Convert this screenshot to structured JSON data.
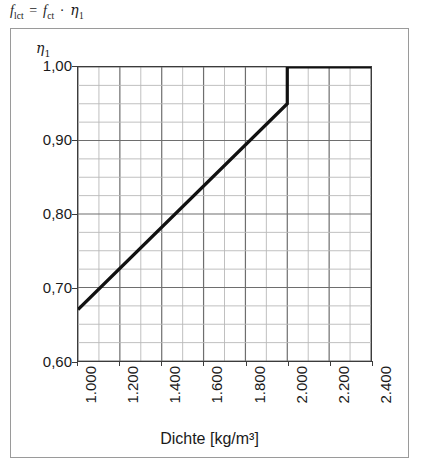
{
  "formula": {
    "lhs_base": "f",
    "lhs_sub": "lct",
    "equals": "=",
    "rhs_base": "f",
    "rhs_sub": "ct",
    "operator": "·",
    "eta_base": "η",
    "eta_sub": "1"
  },
  "axis_symbol": {
    "base": "η",
    "sub": "1"
  },
  "chart_data": {
    "type": "line",
    "title": "",
    "xlabel": "Dichte [kg/m³]",
    "ylabel": "η₁",
    "xlim": [
      1000,
      2400
    ],
    "ylim": [
      0.6,
      1.0
    ],
    "grid": true,
    "x_major_step": 200,
    "x_minor_step": 100,
    "y_major_step": 0.1,
    "y_minor_step": 0.025,
    "legend": "none",
    "x_tick_labels": [
      "1.000",
      "1.200",
      "1.400",
      "1.600",
      "1.800",
      "2.000",
      "2.200",
      "2.400"
    ],
    "x_tick_values": [
      1000,
      1200,
      1400,
      1600,
      1800,
      2000,
      2200,
      2400
    ],
    "y_tick_labels": [
      "1,00",
      "0,90",
      "0,80",
      "0,70",
      "0,60"
    ],
    "y_tick_values": [
      1.0,
      0.9,
      0.8,
      0.7,
      0.6
    ],
    "series": [
      {
        "name": "eta1",
        "color": "#111111",
        "width": 3.2,
        "x": [
          1000,
          2000,
          2000,
          2400
        ],
        "y": [
          0.67,
          0.95,
          1.0,
          1.0
        ]
      }
    ]
  }
}
